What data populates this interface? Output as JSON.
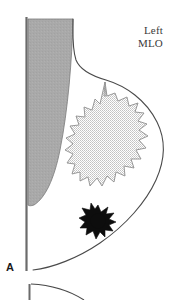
{
  "figure": {
    "panel_letter": "A",
    "view_label_line1": "Left",
    "view_label_line2": "MLO",
    "colors": {
      "pectoral_muscle_fill": "#a8a8a8",
      "pectoral_muscle_stroke": "#6e6e6e",
      "chest_wall_line": "#6b6b6b",
      "breast_outline": "#4a4a4a",
      "glandular_tissue_fill": "#d9d9d9",
      "glandular_tissue_stroke": "#8a8a8a",
      "spiculated_mass": "#0d0d0d",
      "background": "#ffffff",
      "label_text": "#3a3a3a",
      "panel_letter_text": "#1a1a1a"
    },
    "parts": {
      "chest_wall_line": "chest-wall-line",
      "pectoral_muscle": "pectoral-muscle",
      "breast_outline": "breast-outline",
      "glandular_tissue": "glandular-tissue",
      "spiculated_mass": "spiculated-mass",
      "next_figure_fragment": "next-figure-fragment"
    }
  }
}
